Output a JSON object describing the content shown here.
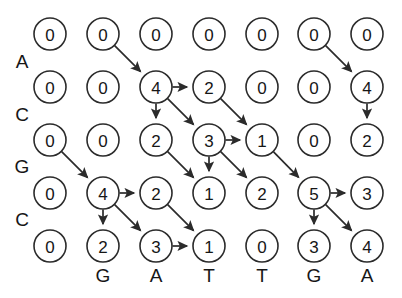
{
  "figure": {
    "type": "alignment-dp-grid",
    "background_color": "#ffffff",
    "node_fill": "#ffffff",
    "node_stroke": "#2b2b2b",
    "text_color": "#161616",
    "rows": 5,
    "cols": 7,
    "node_radius": 16,
    "col_x": [
      50,
      103,
      156,
      209,
      262,
      314,
      367
    ],
    "row_y": [
      34,
      87,
      140,
      193,
      246
    ]
  },
  "row_labels": [
    {
      "text": "A",
      "x": 22,
      "y": 61
    },
    {
      "text": "C",
      "x": 22,
      "y": 114
    },
    {
      "text": "G",
      "x": 22,
      "y": 166
    },
    {
      "text": "C",
      "x": 22,
      "y": 219
    }
  ],
  "col_labels": [
    {
      "text": "G",
      "x": 103,
      "y": 275
    },
    {
      "text": "A",
      "x": 156,
      "y": 275
    },
    {
      "text": "T",
      "x": 209,
      "y": 275
    },
    {
      "text": "T",
      "x": 262,
      "y": 275
    },
    {
      "text": "G",
      "x": 314,
      "y": 275
    },
    {
      "text": "A",
      "x": 367,
      "y": 275
    }
  ],
  "nodes": [
    {
      "row": 0,
      "col": 0,
      "value": "0"
    },
    {
      "row": 0,
      "col": 1,
      "value": "0"
    },
    {
      "row": 0,
      "col": 2,
      "value": "0"
    },
    {
      "row": 0,
      "col": 3,
      "value": "0"
    },
    {
      "row": 0,
      "col": 4,
      "value": "0"
    },
    {
      "row": 0,
      "col": 5,
      "value": "0"
    },
    {
      "row": 0,
      "col": 6,
      "value": "0"
    },
    {
      "row": 1,
      "col": 0,
      "value": "0"
    },
    {
      "row": 1,
      "col": 1,
      "value": "0"
    },
    {
      "row": 1,
      "col": 2,
      "value": "4"
    },
    {
      "row": 1,
      "col": 3,
      "value": "2"
    },
    {
      "row": 1,
      "col": 4,
      "value": "0"
    },
    {
      "row": 1,
      "col": 5,
      "value": "0"
    },
    {
      "row": 1,
      "col": 6,
      "value": "4"
    },
    {
      "row": 2,
      "col": 0,
      "value": "0"
    },
    {
      "row": 2,
      "col": 1,
      "value": "0"
    },
    {
      "row": 2,
      "col": 2,
      "value": "2"
    },
    {
      "row": 2,
      "col": 3,
      "value": "3"
    },
    {
      "row": 2,
      "col": 4,
      "value": "1"
    },
    {
      "row": 2,
      "col": 5,
      "value": "0"
    },
    {
      "row": 2,
      "col": 6,
      "value": "2"
    },
    {
      "row": 3,
      "col": 0,
      "value": "0"
    },
    {
      "row": 3,
      "col": 1,
      "value": "4"
    },
    {
      "row": 3,
      "col": 2,
      "value": "2"
    },
    {
      "row": 3,
      "col": 3,
      "value": "1"
    },
    {
      "row": 3,
      "col": 4,
      "value": "2"
    },
    {
      "row": 3,
      "col": 5,
      "value": "5"
    },
    {
      "row": 3,
      "col": 6,
      "value": "3"
    },
    {
      "row": 4,
      "col": 0,
      "value": "0"
    },
    {
      "row": 4,
      "col": 1,
      "value": "2"
    },
    {
      "row": 4,
      "col": 2,
      "value": "3"
    },
    {
      "row": 4,
      "col": 3,
      "value": "1"
    },
    {
      "row": 4,
      "col": 4,
      "value": "0"
    },
    {
      "row": 4,
      "col": 5,
      "value": "3"
    },
    {
      "row": 4,
      "col": 6,
      "value": "4"
    }
  ],
  "edges": [
    {
      "from": [
        0,
        1
      ],
      "to": [
        1,
        2
      ],
      "kind": "diagonal"
    },
    {
      "from": [
        0,
        5
      ],
      "to": [
        1,
        6
      ],
      "kind": "diagonal"
    },
    {
      "from": [
        1,
        2
      ],
      "to": [
        1,
        3
      ],
      "kind": "right"
    },
    {
      "from": [
        1,
        2
      ],
      "to": [
        2,
        2
      ],
      "kind": "down"
    },
    {
      "from": [
        1,
        2
      ],
      "to": [
        2,
        3
      ],
      "kind": "diagonal"
    },
    {
      "from": [
        1,
        3
      ],
      "to": [
        2,
        4
      ],
      "kind": "diagonal"
    },
    {
      "from": [
        1,
        6
      ],
      "to": [
        2,
        6
      ],
      "kind": "down"
    },
    {
      "from": [
        2,
        0
      ],
      "to": [
        3,
        1
      ],
      "kind": "diagonal"
    },
    {
      "from": [
        2,
        2
      ],
      "to": [
        3,
        3
      ],
      "kind": "diagonal"
    },
    {
      "from": [
        2,
        3
      ],
      "to": [
        2,
        4
      ],
      "kind": "right"
    },
    {
      "from": [
        2,
        3
      ],
      "to": [
        3,
        3
      ],
      "kind": "down"
    },
    {
      "from": [
        2,
        3
      ],
      "to": [
        3,
        4
      ],
      "kind": "diagonal"
    },
    {
      "from": [
        2,
        4
      ],
      "to": [
        3,
        5
      ],
      "kind": "diagonal"
    },
    {
      "from": [
        3,
        1
      ],
      "to": [
        3,
        2
      ],
      "kind": "right"
    },
    {
      "from": [
        3,
        1
      ],
      "to": [
        4,
        1
      ],
      "kind": "down"
    },
    {
      "from": [
        3,
        1
      ],
      "to": [
        4,
        2
      ],
      "kind": "diagonal"
    },
    {
      "from": [
        3,
        2
      ],
      "to": [
        4,
        3
      ],
      "kind": "diagonal"
    },
    {
      "from": [
        3,
        5
      ],
      "to": [
        3,
        6
      ],
      "kind": "right"
    },
    {
      "from": [
        3,
        5
      ],
      "to": [
        4,
        5
      ],
      "kind": "down"
    },
    {
      "from": [
        3,
        5
      ],
      "to": [
        4,
        6
      ],
      "kind": "diagonal"
    },
    {
      "from": [
        4,
        2
      ],
      "to": [
        4,
        3
      ],
      "kind": "right"
    }
  ]
}
